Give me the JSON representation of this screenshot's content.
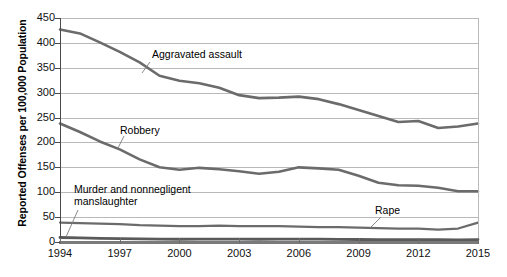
{
  "chart_data": {
    "type": "line",
    "title": "",
    "xlabel": "",
    "ylabel": "Reported Offenses per 100,000 Population",
    "xlim": [
      1994,
      2015
    ],
    "ylim": [
      0,
      450
    ],
    "ytick_step": 50,
    "grid": true,
    "legend_position": "inline-labels",
    "x": [
      1994,
      1995,
      1996,
      1997,
      1998,
      1999,
      2000,
      2001,
      2002,
      2003,
      2004,
      2005,
      2006,
      2007,
      2008,
      2009,
      2010,
      2011,
      2012,
      2013,
      2014,
      2015
    ],
    "y_ticks": [
      "0",
      "50",
      "100",
      "150",
      "200",
      "250",
      "300",
      "350",
      "400",
      "450"
    ],
    "x_ticks": [
      "1994",
      "1997",
      "2000",
      "2003",
      "2006",
      "2009",
      "2012",
      "2015"
    ],
    "series": [
      {
        "name": "Aggravated assault",
        "color": "#6b6b6b",
        "values": [
          427,
          419,
          401,
          382,
          361,
          334,
          324,
          319,
          310,
          295,
          289,
          290,
          292,
          287,
          277,
          265,
          253,
          241,
          243,
          229,
          232,
          238
        ]
      },
      {
        "name": "Robbery",
        "color": "#6b6b6b",
        "values": [
          238,
          221,
          202,
          186,
          166,
          150,
          145,
          149,
          146,
          142,
          137,
          141,
          150,
          148,
          145,
          133,
          119,
          114,
          113,
          109,
          102,
          102
        ]
      },
      {
        "name": "Rape",
        "color": "#6b6b6b",
        "values": [
          39,
          38,
          37,
          36,
          34,
          33,
          32,
          32,
          33,
          32,
          32,
          32,
          31,
          30,
          30,
          29,
          28,
          27,
          27,
          25,
          27,
          39
        ]
      },
      {
        "name": "Murder and nonnegligent manslaughter",
        "color": "#5a5a5a",
        "values": [
          9,
          8.2,
          7.4,
          6.8,
          6.3,
          5.7,
          5.5,
          5.6,
          5.6,
          5.7,
          5.5,
          5.6,
          5.8,
          5.7,
          5.4,
          5.0,
          4.8,
          4.7,
          4.7,
          4.5,
          4.4,
          4.9
        ]
      }
    ],
    "annotations": [
      {
        "text": "Aggravated assault",
        "target_series": "Aggravated assault"
      },
      {
        "text": "Robbery",
        "target_series": "Robbery"
      },
      {
        "text": "Murder and nonnegligent",
        "text_line2": "manslaughter",
        "target_series": "Murder and nonnegligent manslaughter"
      },
      {
        "text": "Rape",
        "target_series": "Rape"
      }
    ]
  }
}
